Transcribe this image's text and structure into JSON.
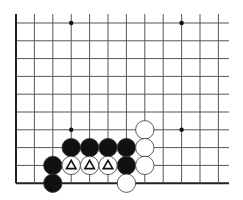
{
  "board": {
    "cols": 12,
    "rows": 10,
    "origin_x": 16,
    "origin_y": 23,
    "dx": 18.4,
    "dy": 17.8,
    "right_extent": 229,
    "top_extent": 14,
    "line_color": "#555555",
    "edge_color": "#222222",
    "hoshi": [
      [
        3,
        0
      ],
      [
        9,
        0
      ],
      [
        3,
        6
      ],
      [
        9,
        6
      ]
    ],
    "stones": [
      {
        "color": "black",
        "col": 2,
        "row": 8
      },
      {
        "color": "black",
        "col": 2,
        "row": 9
      },
      {
        "color": "black",
        "col": 3,
        "row": 7
      },
      {
        "color": "black",
        "col": 4,
        "row": 7
      },
      {
        "color": "black",
        "col": 5,
        "row": 7
      },
      {
        "color": "black",
        "col": 6,
        "row": 7
      },
      {
        "color": "black",
        "col": 6,
        "row": 8
      },
      {
        "color": "white",
        "col": 3,
        "row": 8,
        "mark": "triangle"
      },
      {
        "color": "white",
        "col": 4,
        "row": 8,
        "mark": "triangle"
      },
      {
        "color": "white",
        "col": 5,
        "row": 8,
        "mark": "triangle"
      },
      {
        "color": "white",
        "col": 7,
        "row": 6
      },
      {
        "color": "white",
        "col": 7,
        "row": 7
      },
      {
        "color": "white",
        "col": 7,
        "row": 8
      },
      {
        "color": "white",
        "col": 6,
        "row": 9
      }
    ]
  }
}
